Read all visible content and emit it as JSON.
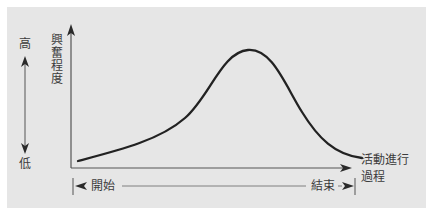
{
  "diagram": {
    "type": "line",
    "title": "",
    "y_axis": {
      "label": "興奮程度",
      "high_label": "高",
      "low_label": "低"
    },
    "x_axis": {
      "label_line1": "活動進行",
      "label_line2": "過程",
      "start_label": "開始",
      "end_label": "結束"
    },
    "curve": {
      "shape": "bell curve skewed, rising slowly then peaking then falling",
      "points_px": [
        [
          78,
          161
        ],
        [
          130,
          148
        ],
        [
          175,
          128
        ],
        [
          200,
          105
        ],
        [
          220,
          75
        ],
        [
          235,
          55
        ],
        [
          248,
          50
        ],
        [
          262,
          54
        ],
        [
          280,
          75
        ],
        [
          300,
          108
        ],
        [
          315,
          132
        ],
        [
          335,
          150
        ],
        [
          362,
          158
        ]
      ]
    },
    "colors": {
      "background": "#e6e6e6",
      "line": "#222222",
      "text": "#3c3c3c"
    }
  }
}
